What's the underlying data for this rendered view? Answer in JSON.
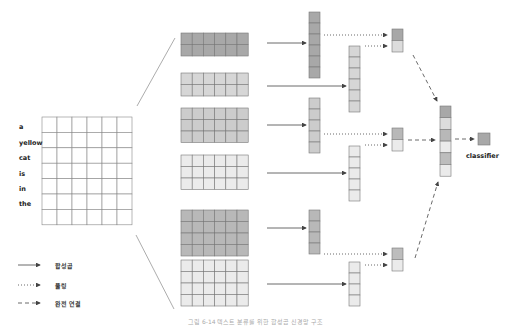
{
  "input": {
    "words": [
      "a",
      "yellow",
      "cat",
      "is",
      "in",
      "the"
    ],
    "grid": {
      "cols": 6,
      "rows": 7
    }
  },
  "filters": [
    {
      "rows": 2,
      "color": "#a8a8a8",
      "feature_cells": 6,
      "feature_color": "#a8a8a8",
      "pooled_colors": [
        "#a8a8a8",
        "#dcdcdc"
      ]
    },
    {
      "rows": 2,
      "color": "#d6d6d6",
      "feature_cells": 6,
      "feature_color": "#d6d6d6"
    },
    {
      "rows": 3,
      "color": "#cccccc",
      "feature_cells": 5,
      "feature_color": "#cccccc",
      "pooled_colors": [
        "#b8b8b8",
        "#ebebeb"
      ]
    },
    {
      "rows": 3,
      "color": "#ebebeb",
      "feature_cells": 5,
      "feature_color": "#ebebeb"
    },
    {
      "rows": 4,
      "color": "#b8b8b8",
      "feature_cells": 4,
      "feature_color": "#b8b8b8",
      "pooled_colors": [
        "#bdbdbd",
        "#ebebeb"
      ]
    },
    {
      "rows": 4,
      "color": "#ebebeb",
      "feature_cells": 4,
      "feature_color": "#ebebeb"
    }
  ],
  "concat_colors": [
    "#a8a8a8",
    "#dcdcdc",
    "#b8b8b8",
    "#ebebeb",
    "#bdbdbd",
    "#ebebeb"
  ],
  "classifier": {
    "label": "classifier",
    "color": "#a8a8a8"
  },
  "legend": {
    "convolution": "합성곱",
    "pooling": "풀링",
    "fully_connected": "완전 연결"
  },
  "caption": "그림 6-14 텍스트 분류를 위한 합성곱 신경망 구조"
}
